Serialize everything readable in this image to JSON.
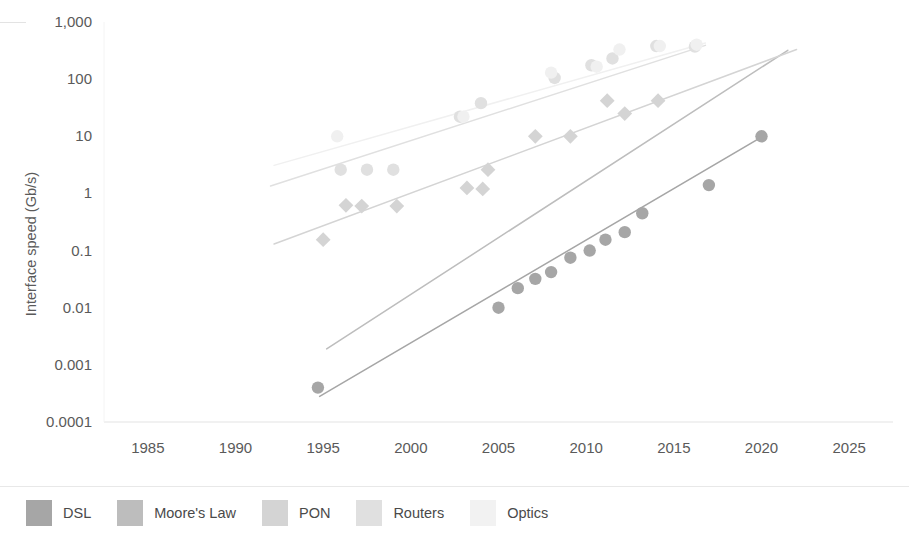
{
  "chart_data": {
    "type": "scatter",
    "title": "",
    "subtitle": "",
    "xlabel": "",
    "ylabel": "Interface speed (Gb/s)",
    "yscale": "log",
    "xscale": "linear",
    "xlim": [
      1982.5,
      2027.5
    ],
    "ylim": [
      0.0001,
      1000
    ],
    "grid": false,
    "legend_position": "bottom-left",
    "x_ticks": [
      "1985",
      "1990",
      "1995",
      "2000",
      "2005",
      "2010",
      "2015",
      "2020",
      "2025"
    ],
    "x_tick_values": [
      1985,
      1990,
      1995,
      2000,
      2005,
      2010,
      2015,
      2020,
      2025
    ],
    "y_ticks": [
      "1,000",
      "100",
      "10",
      "1",
      "0.1",
      "0.01",
      "0.001",
      "0.0001"
    ],
    "y_tick_values": [
      1000,
      100,
      10,
      1,
      0.1,
      0.01,
      0.001,
      0.0001
    ],
    "series": [
      {
        "name": "DSL",
        "color": "#a6a6a6",
        "marker": "circle",
        "has_trendline": true,
        "points": [
          {
            "x": 1994.7,
            "y": 0.0004
          },
          {
            "x": 2005.0,
            "y": 0.01
          },
          {
            "x": 2006.1,
            "y": 0.022
          },
          {
            "x": 2007.1,
            "y": 0.032
          },
          {
            "x": 2008.0,
            "y": 0.042
          },
          {
            "x": 2009.1,
            "y": 0.075
          },
          {
            "x": 2010.2,
            "y": 0.1
          },
          {
            "x": 2011.1,
            "y": 0.155
          },
          {
            "x": 2012.2,
            "y": 0.21
          },
          {
            "x": 2013.2,
            "y": 0.45
          },
          {
            "x": 2017.0,
            "y": 1.4
          },
          {
            "x": 2020.0,
            "y": 10
          }
        ],
        "trendline": [
          {
            "x": 1994.8,
            "y": 0.00028
          },
          {
            "x": 2020.2,
            "y": 10.5
          }
        ]
      },
      {
        "name": "Moore's Law",
        "color": "#bdbdbd",
        "marker": "none",
        "has_trendline": true,
        "points": [],
        "trendline": [
          {
            "x": 1995.2,
            "y": 0.0019
          },
          {
            "x": 2021.5,
            "y": 320
          }
        ]
      },
      {
        "name": "PON",
        "color": "#d4d4d4",
        "marker": "diamond",
        "has_trendline": true,
        "points": [
          {
            "x": 1995.0,
            "y": 0.155
          },
          {
            "x": 1996.3,
            "y": 0.62
          },
          {
            "x": 1997.2,
            "y": 0.6
          },
          {
            "x": 1999.2,
            "y": 0.6
          },
          {
            "x": 2003.2,
            "y": 1.25
          },
          {
            "x": 2004.1,
            "y": 1.2
          },
          {
            "x": 2004.4,
            "y": 2.6
          },
          {
            "x": 2007.1,
            "y": 10
          },
          {
            "x": 2009.1,
            "y": 10
          },
          {
            "x": 2011.2,
            "y": 42
          },
          {
            "x": 2012.2,
            "y": 25
          },
          {
            "x": 2014.1,
            "y": 42
          }
        ],
        "trendline": [
          {
            "x": 1992.2,
            "y": 0.13
          },
          {
            "x": 2022.0,
            "y": 330
          }
        ]
      },
      {
        "name": "Routers",
        "color": "#e0e0e0",
        "marker": "circle",
        "has_trendline": true,
        "points": [
          {
            "x": 1996.0,
            "y": 2.6
          },
          {
            "x": 1997.5,
            "y": 2.6
          },
          {
            "x": 1999.0,
            "y": 2.6
          },
          {
            "x": 2002.8,
            "y": 22
          },
          {
            "x": 2004.0,
            "y": 38
          },
          {
            "x": 2008.2,
            "y": 105
          },
          {
            "x": 2010.3,
            "y": 175
          },
          {
            "x": 2011.5,
            "y": 230
          },
          {
            "x": 2014.0,
            "y": 380
          },
          {
            "x": 2016.2,
            "y": 370
          }
        ],
        "trendline": [
          {
            "x": 1992.0,
            "y": 1.35
          },
          {
            "x": 2016.8,
            "y": 390
          }
        ]
      },
      {
        "name": "Optics",
        "color": "#f0f0f0",
        "marker": "circle",
        "has_trendline": true,
        "points": [
          {
            "x": 1995.8,
            "y": 10
          },
          {
            "x": 2003.0,
            "y": 22
          },
          {
            "x": 2008.0,
            "y": 130
          },
          {
            "x": 2010.6,
            "y": 165
          },
          {
            "x": 2011.9,
            "y": 330
          },
          {
            "x": 2014.2,
            "y": 380
          },
          {
            "x": 2016.3,
            "y": 400
          }
        ],
        "trendline": [
          {
            "x": 1992.2,
            "y": 3.1
          },
          {
            "x": 2016.8,
            "y": 430
          }
        ]
      }
    ]
  },
  "legend": {
    "items": [
      {
        "label": "DSL",
        "color": "#a6a6a6"
      },
      {
        "label": "Moore's Law",
        "color": "#bdbdbd"
      },
      {
        "label": "PON",
        "color": "#d4d4d4"
      },
      {
        "label": "Routers",
        "color": "#e0e0e0"
      },
      {
        "label": "Optics",
        "color": "#f2f2f2"
      }
    ]
  },
  "axes": {
    "y_title": "Interface speed (Gb/s)"
  }
}
